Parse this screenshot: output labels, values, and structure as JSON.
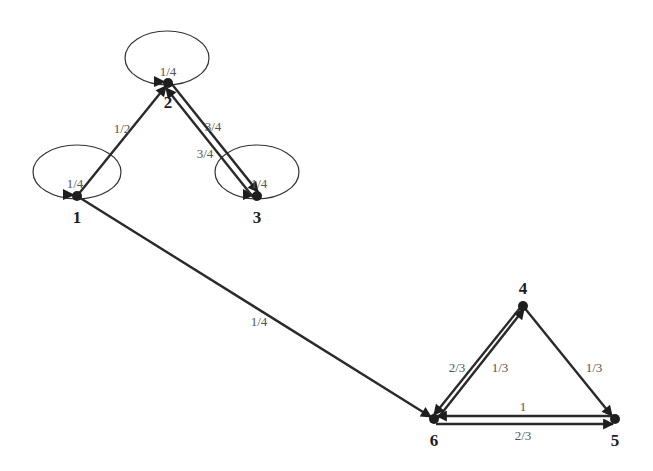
{
  "diagram": {
    "type": "markov-chain",
    "nodes": [
      {
        "id": "1",
        "label": "1",
        "x": 77,
        "y": 196,
        "lx": 77,
        "ly": 223
      },
      {
        "id": "2",
        "label": "2",
        "x": 168,
        "y": 83,
        "lx": 168,
        "ly": 108
      },
      {
        "id": "3",
        "label": "3",
        "x": 257,
        "y": 196,
        "lx": 257,
        "ly": 223
      },
      {
        "id": "4",
        "label": "4",
        "x": 523,
        "y": 306,
        "lx": 523,
        "ly": 294
      },
      {
        "id": "5",
        "label": "5",
        "x": 615,
        "y": 419,
        "lx": 615,
        "ly": 446
      },
      {
        "id": "6",
        "label": "6",
        "x": 434,
        "y": 419,
        "lx": 434,
        "ly": 446
      }
    ],
    "loops": [
      {
        "node": "1",
        "label": "1/4",
        "cx": 77,
        "cy": 172,
        "rx": 44,
        "ry": 27,
        "lx": 75,
        "ly": 188
      },
      {
        "node": "2",
        "label": "1/4",
        "cx": 167,
        "cy": 58,
        "rx": 42,
        "ry": 27,
        "lx": 168,
        "ly": 76
      },
      {
        "node": "3",
        "label": "1/4",
        "cx": 257,
        "cy": 172,
        "rx": 42,
        "ry": 27,
        "lx": 259,
        "ly": 188
      }
    ],
    "edges": [
      {
        "from": "1",
        "to": "2",
        "label": "1/2",
        "x1": 77,
        "y1": 196,
        "x2": 166,
        "y2": 86,
        "lx": 122,
        "ly": 133
      },
      {
        "from": "2",
        "to": "3",
        "label": "3/4",
        "x1": 171,
        "y1": 83,
        "x2": 258,
        "y2": 192,
        "lx": 213,
        "ly": 131
      },
      {
        "from": "3",
        "to": "2",
        "label": "3/4",
        "x1": 253,
        "y1": 197,
        "x2": 166,
        "y2": 88,
        "lx": 205,
        "ly": 158
      },
      {
        "from": "1",
        "to": "6",
        "label": "1/4",
        "x1": 77,
        "y1": 196,
        "x2": 431,
        "y2": 417,
        "lx": 259,
        "ly": 326
      },
      {
        "from": "6",
        "to": "4",
        "label": "1/3",
        "x1": 438,
        "y1": 418,
        "x2": 524,
        "y2": 309,
        "lx": 500,
        "ly": 372
      },
      {
        "from": "4",
        "to": "6",
        "label": "2/3",
        "x1": 520,
        "y1": 308,
        "x2": 434,
        "y2": 415,
        "lx": 457,
        "ly": 372
      },
      {
        "from": "4",
        "to": "5",
        "label": "1/3",
        "x1": 523,
        "y1": 306,
        "x2": 612,
        "y2": 416,
        "lx": 594,
        "ly": 372
      },
      {
        "from": "5",
        "to": "6",
        "label": "1",
        "x1": 614,
        "y1": 416,
        "x2": 437,
        "y2": 416,
        "lx": 523,
        "ly": 411
      },
      {
        "from": "6",
        "to": "5",
        "label": "2/3",
        "x1": 436,
        "y1": 424,
        "x2": 613,
        "y2": 424,
        "lx": 523,
        "ly": 440
      }
    ]
  }
}
